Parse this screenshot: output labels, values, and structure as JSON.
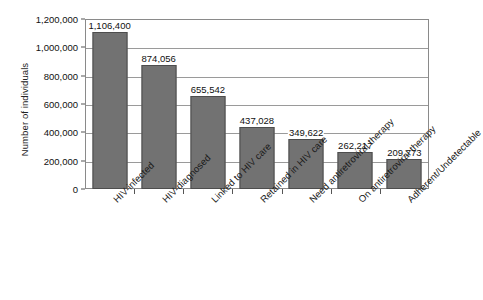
{
  "chart_data": {
    "type": "bar",
    "title": "",
    "subtitle": "",
    "xlabel": "",
    "ylabel": "Number of individuals",
    "ylim": [
      0,
      1200000
    ],
    "ytick_labels": [
      "0",
      "200,000",
      "400,000",
      "600,000",
      "800,000",
      "1,000,000",
      "1,200,000"
    ],
    "ytick_values": [
      0,
      200000,
      400000,
      600000,
      800000,
      1000000,
      1200000
    ],
    "grid": true,
    "legend": "none",
    "orientation": "vertical",
    "bar_color": "#727272",
    "categories": [
      "HIV-infected",
      "HIV-diagnosed",
      "Linked to HIV care",
      "Retained in HIV care",
      "Need antiretroviral therapy",
      "On antiretroviral therapy",
      "Adherent/Undetectable"
    ],
    "values": [
      1106400,
      874056,
      655542,
      437028,
      349622,
      262217,
      209773
    ],
    "value_labels": [
      "1,106,400",
      "874,056",
      "655,542",
      "437,028",
      "349,622",
      "262,217",
      "209,773"
    ]
  }
}
